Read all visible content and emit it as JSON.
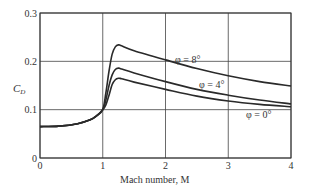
{
  "chart_data": {
    "type": "line",
    "title": "",
    "xlabel": "Mach number, M",
    "ylabel": "C_D",
    "xlim": [
      0,
      4
    ],
    "ylim": [
      0,
      0.3
    ],
    "xticks": [
      "0",
      "1",
      "2",
      "3",
      "4"
    ],
    "yticks": [
      "0",
      "0.1",
      "0.2",
      "0.3"
    ],
    "grid": true,
    "legend_position": "inline labels",
    "series": [
      {
        "name": "φ=8°",
        "label": "φ = 8°",
        "x": [
          0,
          0.3,
          0.6,
          0.8,
          0.9,
          1.0,
          1.05,
          1.1,
          1.15,
          1.2,
          1.25,
          1.3,
          1.5,
          2.0,
          2.5,
          3.0,
          3.5,
          4.0
        ],
        "y": [
          0.065,
          0.066,
          0.071,
          0.079,
          0.087,
          0.1,
          0.135,
          0.18,
          0.215,
          0.23,
          0.234,
          0.232,
          0.222,
          0.203,
          0.185,
          0.17,
          0.158,
          0.149
        ]
      },
      {
        "name": "φ=4°",
        "label": "φ = 4°",
        "x": [
          0,
          0.3,
          0.6,
          0.8,
          0.9,
          1.0,
          1.05,
          1.1,
          1.15,
          1.2,
          1.25,
          1.3,
          1.5,
          2.0,
          2.5,
          3.0,
          3.5,
          4.0
        ],
        "y": [
          0.065,
          0.066,
          0.071,
          0.079,
          0.087,
          0.1,
          0.12,
          0.15,
          0.172,
          0.183,
          0.186,
          0.184,
          0.176,
          0.158,
          0.142,
          0.13,
          0.12,
          0.112
        ]
      },
      {
        "name": "φ=0°",
        "label": "φ = 0°",
        "x": [
          0,
          0.3,
          0.6,
          0.8,
          0.9,
          1.0,
          1.05,
          1.1,
          1.15,
          1.2,
          1.25,
          1.3,
          1.5,
          2.0,
          2.5,
          3.0,
          3.5,
          4.0
        ],
        "y": [
          0.065,
          0.066,
          0.071,
          0.079,
          0.087,
          0.1,
          0.11,
          0.13,
          0.152,
          0.162,
          0.165,
          0.164,
          0.157,
          0.142,
          0.128,
          0.118,
          0.111,
          0.106
        ]
      }
    ],
    "annotations": [
      {
        "text": "φ = 8°",
        "x": 2.1,
        "y": 0.2
      },
      {
        "text": "φ = 4°",
        "x": 2.6,
        "y": 0.155
      },
      {
        "text": "φ = 0°",
        "x": 3.35,
        "y": 0.09
      }
    ]
  },
  "labels": {
    "xlabel": "Mach number, M",
    "ylabel_main": "C",
    "ylabel_sub": "D",
    "origin_y": "0",
    "phi8": "φ = 8°",
    "phi4": "φ = 4°",
    "phi0": "φ = 0°"
  },
  "colors": {
    "curve": "#2a2a2a",
    "grid": "#444444",
    "text": "#333333"
  }
}
